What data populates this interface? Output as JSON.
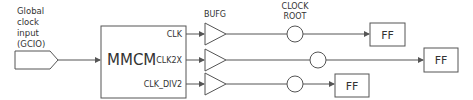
{
  "diagram": {
    "input": {
      "label_lines": [
        "Global",
        "clock",
        "input",
        "(GCIO)"
      ]
    },
    "mmcm": {
      "label": "MMCM",
      "outputs": [
        "CLK",
        "CLK2X",
        "CLK_DIV2"
      ]
    },
    "buffer_label": "BUFG",
    "clock_root_label_lines": [
      "CLOCK",
      "ROOT"
    ],
    "flip_flops": [
      "FF",
      "FF",
      "FF"
    ],
    "colors": {
      "line": "#555555",
      "text": "#333333",
      "background": "#ffffff"
    }
  }
}
